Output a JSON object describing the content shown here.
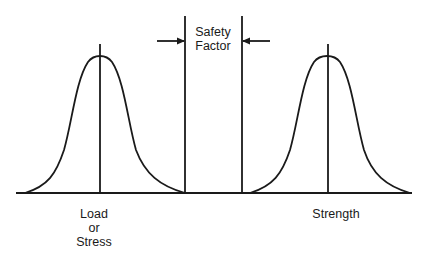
{
  "diagram": {
    "labels": {
      "safety_factor": [
        "Safety",
        "Factor"
      ],
      "load": [
        "Load",
        "or",
        "Stress"
      ],
      "strength": "Strength"
    },
    "colors": {
      "line": "#1a1a1a",
      "background": "#ffffff"
    },
    "elements": {
      "left_curve": {
        "name": "Load or Stress distribution",
        "mean_x": 100,
        "peak_y": 55
      },
      "right_curve": {
        "name": "Strength distribution",
        "mean_x": 328,
        "peak_y": 54
      },
      "safety_margin": {
        "left_x": 185,
        "right_x": 242
      }
    }
  }
}
